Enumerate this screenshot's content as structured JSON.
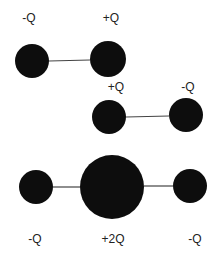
{
  "diagram": {
    "title": "",
    "configurations": [
      {
        "id": "dipole-top",
        "charges": [
          {
            "label": "-Q",
            "cx": 32,
            "cy": 61,
            "r": 17,
            "lx": 29,
            "ly": 22
          },
          {
            "label": "+Q",
            "cx": 108,
            "cy": 59,
            "r": 18,
            "lx": 111,
            "ly": 22
          }
        ],
        "bonds": [
          [
            49,
            61,
            90,
            60
          ]
        ]
      },
      {
        "id": "dipole-middle",
        "charges": [
          {
            "label": "+Q",
            "cx": 109,
            "cy": 117,
            "r": 17,
            "lx": 116,
            "ly": 91
          },
          {
            "label": "-Q",
            "cx": 186,
            "cy": 115,
            "r": 17,
            "lx": 188,
            "ly": 91
          }
        ],
        "bonds": [
          [
            126,
            117,
            169,
            116
          ]
        ]
      },
      {
        "id": "quadrupole-bottom",
        "charges": [
          {
            "label": "-Q",
            "cx": 36,
            "cy": 187,
            "r": 17,
            "lx": 35,
            "ly": 243
          },
          {
            "label": "+2Q",
            "cx": 112,
            "cy": 187,
            "r": 32,
            "lx": 113,
            "ly": 243
          },
          {
            "label": "-Q",
            "cx": 190,
            "cy": 186,
            "r": 17,
            "lx": 195,
            "ly": 243
          }
        ],
        "bonds": [
          [
            53,
            187,
            80,
            187
          ],
          [
            144,
            186,
            173,
            186
          ]
        ]
      }
    ],
    "colors": {
      "charge_fill": "#0d0d0d",
      "bond": "#444444",
      "label": "#222222"
    }
  }
}
